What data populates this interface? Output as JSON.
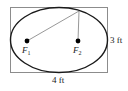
{
  "figure": {
    "colors": {
      "rectangle_stroke": "#8c8c8c",
      "ellipse_stroke": "#1a1a1a",
      "ray_stroke": "#8c8c8c",
      "focus_fill": "#000000",
      "text": "#1a1a1a",
      "background": "#ffffff"
    },
    "rectangle": {
      "x": 10,
      "y": 7,
      "width": 98,
      "height": 66,
      "stroke_width": 1
    },
    "ellipse": {
      "cx": 59,
      "cy": 40,
      "rx": 49,
      "ry": 33,
      "stroke_width": 1.4
    },
    "foci": [
      {
        "name": "F1",
        "label": "F",
        "subscript": "1",
        "cx": 27,
        "cy": 41,
        "r": 2.4
      },
      {
        "name": "F2",
        "label": "F",
        "subscript": "2",
        "cx": 78,
        "cy": 41,
        "r": 2.4
      }
    ],
    "point_on_ellipse": {
      "cx": 79,
      "cy": 11
    },
    "rays": [
      {
        "name": "focus-1-to-point",
        "x1": 27,
        "y1": 41,
        "x2": 79,
        "y2": 11
      },
      {
        "name": "focus-2-to-point",
        "x1": 78,
        "y1": 41,
        "x2": 79,
        "y2": 11
      }
    ],
    "dimensions": {
      "height_label": "3 ft",
      "width_label": "4 ft"
    }
  }
}
